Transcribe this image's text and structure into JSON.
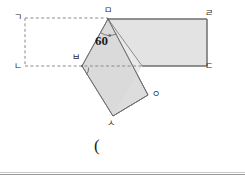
{
  "figure": {
    "colors": {
      "shape_fill": "#e3e3e3",
      "overlap_fill": "#dcdcdc",
      "stroke": "#6f6f6f",
      "dashed_stroke": "#8a8a8a",
      "label_text": "#2a2a2a",
      "rule": "#9a9a9a"
    },
    "vertex_labels": [
      {
        "id": "gieuk",
        "text": "ㄱ",
        "x": 14,
        "y": 13
      },
      {
        "id": "nieun",
        "text": "ㄴ",
        "x": 14,
        "y": 62
      },
      {
        "id": "digeut",
        "text": "ㄷ",
        "x": 205,
        "y": 62
      },
      {
        "id": "rieul",
        "text": "ㄹ",
        "x": 205,
        "y": 9
      },
      {
        "id": "mieum",
        "text": "ㅁ",
        "x": 104,
        "y": 7
      },
      {
        "id": "bieup",
        "text": "ㅂ",
        "x": 72,
        "y": 54
      },
      {
        "id": "siot",
        "text": "ㅅ",
        "x": 107,
        "y": 119
      },
      {
        "id": "ieung",
        "text": "ㅇ",
        "x": 152,
        "y": 90
      }
    ],
    "angle": {
      "value": "60",
      "unit": "°",
      "x": 95,
      "y": 35
    },
    "answer_paren": {
      "text": "(",
      "x": 94,
      "y": 139
    },
    "geometry": {
      "dashed_rect": {
        "points": "25,18 108,18 108,66 25,66"
      },
      "right_rect": {
        "points": "108,19 207,19 207,66 142,66"
      },
      "rotated_square": {
        "points": "108,19 82,66 113,116 148,95"
      },
      "overlap_region": {
        "points": "108,19 142,66 113,116 82,66"
      }
    }
  }
}
